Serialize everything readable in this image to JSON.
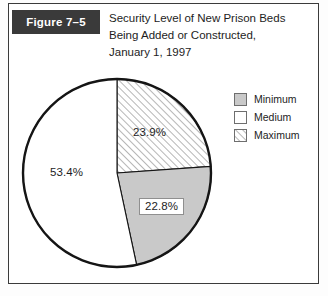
{
  "figure": {
    "label": "Figure 7–5",
    "title_lines": [
      "Security Level of New Prison Beds",
      "Being Added or Constructed,",
      "January 1, 1997"
    ],
    "label_chip_bg": "#3a3a3a",
    "label_chip_fg": "#ffffff",
    "border_color": "#3b3b3b"
  },
  "legend": {
    "position": "right",
    "items": [
      {
        "label": "Minimum",
        "swatch": "solid-gray-swatch",
        "fill": "#c9c9c9"
      },
      {
        "label": "Medium",
        "swatch": "solid-white-swatch",
        "fill": "#ffffff"
      },
      {
        "label": "Maximum",
        "swatch": "diagonal-hatch-swatch",
        "fill": "hatch"
      }
    ]
  },
  "chart_data": {
    "type": "pie",
    "title": "Security Level of New Prison Beds Being Added or Constructed, January 1, 1997",
    "xlabel": "",
    "ylabel": "",
    "grid": false,
    "legend_position": "right",
    "units": "percent",
    "start_angle_deg": 0,
    "direction": "clockwise",
    "categories": [
      "Maximum",
      "Minimum",
      "Medium"
    ],
    "values": [
      23.9,
      22.8,
      53.4
    ],
    "labels": [
      "23.9%",
      "22.8%",
      "53.4%"
    ],
    "slices": [
      {
        "name": "Maximum",
        "value": 23.9,
        "label": "23.9%",
        "fill_style": "diagonal-hatch",
        "fill": "#ffffff",
        "hatch_color": "#8a8a8a",
        "start_deg": 0.0,
        "end_deg": 86.04,
        "label_boxed": false
      },
      {
        "name": "Minimum",
        "value": 22.8,
        "label": "22.8%",
        "fill_style": "solid",
        "fill": "#c9c9c9",
        "hatch_color": "",
        "start_deg": 86.04,
        "end_deg": 168.12,
        "label_boxed": true
      },
      {
        "name": "Medium",
        "value": 53.4,
        "label": "53.4%",
        "fill_style": "solid",
        "fill": "#ffffff",
        "hatch_color": "",
        "start_deg": 168.12,
        "end_deg": 360.0,
        "label_boxed": false
      }
    ],
    "outline_color": "#151515",
    "geometry": {
      "cx": 99,
      "cy": 101,
      "r": 94
    }
  }
}
